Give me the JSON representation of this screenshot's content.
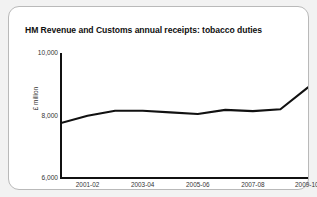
{
  "card": {
    "title": "HM Revenue and Customs annual receipts: tobacco duties"
  },
  "chart_data": {
    "type": "line",
    "title": "HM Revenue and Customs annual receipts: tobacco duties",
    "xlabel": "",
    "ylabel": "£ million",
    "ylim": [
      6000,
      10000
    ],
    "yticks": [
      "6,000",
      "8,000",
      "10,000"
    ],
    "ytick_values": [
      6000,
      8000,
      10000
    ],
    "grid": false,
    "legend": false,
    "line_color": "#111111",
    "categories": [
      "2000-01",
      "2001-02",
      "2002-03",
      "2003-04",
      "2004-05",
      "2005-06",
      "2006-07",
      "2007-08",
      "2008-09",
      "2009-10"
    ],
    "xtick_labels": [
      "2001-02",
      "2003-04",
      "2005-06",
      "2007-08",
      "2009-10"
    ],
    "xtick_footnote": "1",
    "values": [
      7750,
      7990,
      8150,
      8150,
      8100,
      8050,
      8180,
      8140,
      8200,
      8900
    ],
    "series": [
      {
        "name": "Tobacco duties",
        "values": [
          7750,
          7990,
          8150,
          8150,
          8100,
          8050,
          8180,
          8140,
          8200,
          8900
        ]
      }
    ]
  }
}
